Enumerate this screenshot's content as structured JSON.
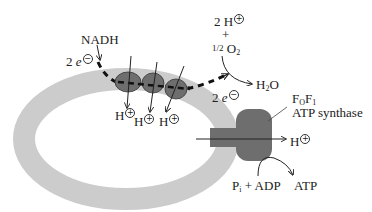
{
  "diagram": {
    "colors": {
      "membrane": "#cccccc",
      "protein": "#6e6e6e",
      "arrow": "#222222",
      "background": "#ffffff"
    },
    "labels": {
      "nadh": "NADH",
      "electrons_in": {
        "coef": "2",
        "symbol": "e",
        "charge": "−"
      },
      "electrons_out": {
        "coef": "2",
        "symbol": "e",
        "charge": "−"
      },
      "protons_reactant": {
        "text": "2 H",
        "charge": "+"
      },
      "plus": "+",
      "oxygen": {
        "fraction": "1/2",
        "symbol": "O",
        "subscript": "2"
      },
      "water": {
        "symbol": "H",
        "subscript": "2",
        "suffix": "O"
      },
      "pumped_protons": [
        {
          "text": "H",
          "charge": "+"
        },
        {
          "text": "H",
          "charge": "+"
        },
        {
          "text": "H",
          "charge": "+"
        }
      ],
      "synthase_name_line1": {
        "f0": "F",
        "f0_sub": "O",
        "f1": "F",
        "f1_sub": "1"
      },
      "synthase_name_line2": "ATP synthase",
      "synthase_proton": {
        "text": "H",
        "charge": "+"
      },
      "phosphate": {
        "symbol": "P",
        "subscript": "i"
      },
      "substrate_plus": "+",
      "adp": "ADP",
      "atp": "ATP"
    },
    "elements": {
      "membrane_shape": "ellipse-ring",
      "electron_carriers": 3,
      "synthase_parts": [
        "F0-stalk",
        "F1-head"
      ]
    }
  }
}
